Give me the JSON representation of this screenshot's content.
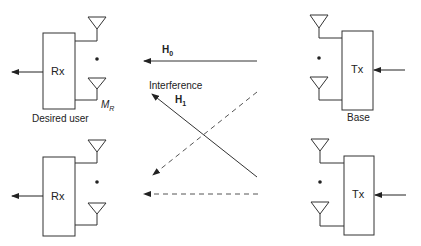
{
  "diagram": {
    "receivers": [
      {
        "id": "rx-top",
        "label": "Rx",
        "caption": "Desired user",
        "antenna_label": {
          "main": "M",
          "sub": "R"
        }
      },
      {
        "id": "rx-bottom",
        "label": "Rx"
      }
    ],
    "transmitters": [
      {
        "id": "tx-top",
        "label": "Tx",
        "caption": "Base"
      },
      {
        "id": "tx-bottom",
        "label": "Tx"
      }
    ],
    "links": [
      {
        "id": "H0",
        "label_main": "H",
        "label_sub": "0",
        "from": "tx-top",
        "to": "rx-top",
        "style": "solid"
      },
      {
        "id": "H1",
        "label_main": "H",
        "label_sub": "1",
        "from": "tx-bottom",
        "to": "rx-top",
        "style": "solid",
        "annotation": "Interference"
      },
      {
        "id": "cross-dashed",
        "from": "tx-top",
        "to": "rx-bottom",
        "style": "dashed"
      },
      {
        "id": "bottom-dashed",
        "from": "tx-bottom",
        "to": "rx-bottom",
        "style": "dashed"
      }
    ],
    "colors": {
      "stroke": "#333333",
      "dashed": "#555555",
      "background": "#ffffff"
    }
  }
}
